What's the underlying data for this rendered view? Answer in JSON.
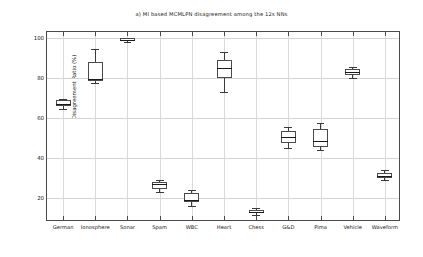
{
  "chart_data": {
    "type": "box",
    "title": "a) MI based MCMLPN disagreement among the 12s NNs",
    "xlabel": "",
    "ylabel": "Disagreement Ratio (%)",
    "ylim": [
      8,
      103
    ],
    "yticks": [
      20,
      40,
      60,
      80,
      100
    ],
    "ytick_labels": [
      "20",
      "40",
      "60",
      "80",
      "100"
    ],
    "grid": true,
    "legend": "none",
    "categories": [
      "German",
      "Ionosphere",
      "Sonar",
      "Spam",
      "WBC",
      "Heart",
      "Chess",
      "G&D",
      "Pima",
      "Vehicle",
      "Waveform"
    ],
    "boxes": [
      {
        "label": "German",
        "whisker_low": 64.5,
        "q1": 66.0,
        "median": 67.2,
        "q3": 68.8,
        "whisker_high": 69.5
      },
      {
        "label": "Ionosphere",
        "whisker_low": 77.5,
        "q1": 78.5,
        "median": 79.5,
        "q3": 88.0,
        "whisker_high": 94.5
      },
      {
        "label": "Sonar",
        "whisker_low": 98.0,
        "q1": 98.7,
        "median": 99.2,
        "q3": 99.8,
        "whisker_high": 100.0
      },
      {
        "label": "Spam",
        "whisker_low": 23.0,
        "q1": 24.5,
        "median": 27.0,
        "q3": 28.0,
        "whisker_high": 29.0
      },
      {
        "label": "WBC",
        "whisker_low": 16.0,
        "q1": 18.0,
        "median": 19.0,
        "q3": 22.5,
        "whisker_high": 24.0
      },
      {
        "label": "Heart",
        "whisker_low": 73.0,
        "q1": 80.0,
        "median": 85.0,
        "q3": 89.0,
        "whisker_high": 93.0
      },
      {
        "label": "Chess",
        "whisker_low": 11.5,
        "q1": 12.5,
        "median": 13.2,
        "q3": 14.0,
        "whisker_high": 14.8
      },
      {
        "label": "G&D",
        "whisker_low": 45.0,
        "q1": 47.5,
        "median": 50.5,
        "q3": 53.5,
        "whisker_high": 55.5
      },
      {
        "label": "Pima",
        "whisker_low": 44.0,
        "q1": 45.5,
        "median": 48.5,
        "q3": 54.5,
        "whisker_high": 57.5
      },
      {
        "label": "Vehicle",
        "whisker_low": 80.0,
        "q1": 81.5,
        "median": 83.0,
        "q3": 84.5,
        "whisker_high": 85.5
      },
      {
        "label": "Waveform",
        "whisker_low": 29.0,
        "q1": 30.0,
        "median": 31.0,
        "q3": 32.5,
        "whisker_high": 34.0
      }
    ]
  }
}
